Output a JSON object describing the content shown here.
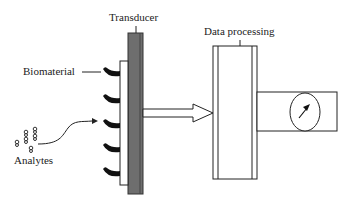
{
  "diagram": {
    "labels": {
      "transducer": "Transducer",
      "data_processing": "Data processing",
      "biomaterial": "Biomaterial",
      "analytes": "Analytes"
    },
    "colors": {
      "transducer_fill": "#6e6e6e",
      "line": "#222222",
      "biomaterial": "#111111"
    }
  }
}
